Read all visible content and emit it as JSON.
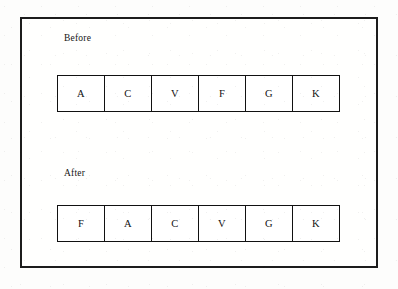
{
  "figure": {
    "sections": [
      {
        "id": "before",
        "label": "Before",
        "cells": [
          "A",
          "C",
          "V",
          "F",
          "G",
          "K"
        ]
      },
      {
        "id": "after",
        "label": "After",
        "cells": [
          "F",
          "A",
          "C",
          "V",
          "G",
          "K"
        ]
      }
    ],
    "colors": {
      "ink": "#111111",
      "paper": "#fdfdfc"
    }
  },
  "chart_data": {
    "type": "table",
    "title": "",
    "series": [
      {
        "name": "Before",
        "values": [
          "A",
          "C",
          "V",
          "F",
          "G",
          "K"
        ]
      },
      {
        "name": "After",
        "values": [
          "F",
          "A",
          "C",
          "V",
          "G",
          "K"
        ]
      }
    ],
    "categories": [
      "1",
      "2",
      "3",
      "4",
      "5",
      "6"
    ]
  }
}
